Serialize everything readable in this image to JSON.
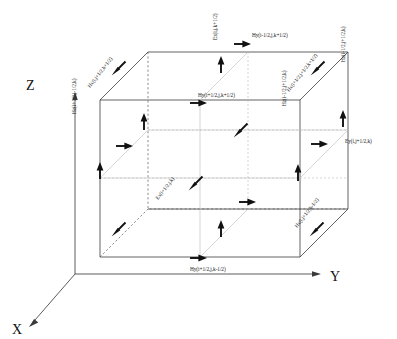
{
  "figure": {
    "type": "yee-cell-diagram",
    "axes": [
      {
        "name": "z-axis",
        "label": "Z",
        "direction": "up",
        "label_x": 26,
        "label_y": 90
      },
      {
        "name": "y-axis",
        "label": "Y",
        "direction": "right",
        "label_x": 330,
        "label_y": 281
      },
      {
        "name": "x-axis",
        "label": "X",
        "direction": "down-left",
        "label_x": 12,
        "label_y": 334
      }
    ],
    "field_labels": [
      {
        "name": "ez-top",
        "text": "Ez(i,j,k+1/2)",
        "x": 217,
        "y": 40,
        "rotate": -90
      },
      {
        "name": "hy-top-back",
        "text": "Hy(i-1/2,j,k+1/2)",
        "x": 252,
        "y": 37,
        "rotate": 0
      },
      {
        "name": "hx-top-left",
        "text": "Hx(i,j+1/2,k+1/2)",
        "x": 90,
        "y": 88,
        "rotate": -52
      },
      {
        "name": "hx-top-right",
        "text": "Hx(i+1/2,j+1/2,k+1/2)",
        "x": 289,
        "y": 92,
        "rotate": -52
      },
      {
        "name": "hz-right-back",
        "text": "Hz(i-1/2,j+1/2,k)",
        "x": 345,
        "y": 62,
        "rotate": -90
      },
      {
        "name": "hy-mid-front",
        "text": "Hy(i+1/2,j,k+1/2)",
        "x": 198,
        "y": 97,
        "rotate": 0
      },
      {
        "name": "hz-left-front",
        "text": "Hz(i+1/2,j-1/2,k)",
        "x": 76,
        "y": 114,
        "rotate": -90
      },
      {
        "name": "hz-mid-right",
        "text": "Hz(i-1/2,j+1/2,k)",
        "x": 286,
        "y": 106,
        "rotate": -90
      },
      {
        "name": "ey-right",
        "text": "Ey(i,j+1/2,k)",
        "x": 345,
        "y": 143,
        "rotate": 0
      },
      {
        "name": "ex-interior",
        "text": "Ex(i+1/2,j,k)",
        "x": 158,
        "y": 200,
        "rotate": -52
      },
      {
        "name": "hx-bottom-right",
        "text": "Hx(i,j+1/2,k-1/2)",
        "x": 297,
        "y": 228,
        "rotate": -52
      },
      {
        "name": "hy-bottom-front",
        "text": "Hy(i+1/2,j,k-1/2)",
        "x": 190,
        "y": 271,
        "rotate": 0
      }
    ],
    "vectors": [
      {
        "name": "vector-ez-top",
        "kind": "up",
        "x": 221,
        "y": 64
      },
      {
        "name": "vector-hy-top-back",
        "kind": "right",
        "x": 243,
        "y": 44
      },
      {
        "name": "vector-hx-top-left",
        "kind": "diag",
        "x": 118,
        "y": 69
      },
      {
        "name": "vector-hx-top-right",
        "kind": "diag",
        "x": 317,
        "y": 69
      },
      {
        "name": "vector-hz-right-back",
        "kind": "up",
        "x": 343,
        "y": 118
      },
      {
        "name": "vector-hy-mid-front",
        "kind": "right",
        "x": 199,
        "y": 103
      },
      {
        "name": "vector-ez-left-upper",
        "kind": "up",
        "x": 144,
        "y": 121
      },
      {
        "name": "vector-hz-left-mid",
        "kind": "right",
        "x": 125,
        "y": 146
      },
      {
        "name": "vector-hz-left-lower",
        "kind": "up",
        "x": 100,
        "y": 170
      },
      {
        "name": "vector-hz-mid-right",
        "kind": "diag",
        "x": 240,
        "y": 131
      },
      {
        "name": "vector-ey-right",
        "kind": "right",
        "x": 320,
        "y": 144
      },
      {
        "name": "vector-hz-right-lower",
        "kind": "up",
        "x": 298,
        "y": 172
      },
      {
        "name": "vector-ex-interior-diag",
        "kind": "diag",
        "x": 195,
        "y": 184
      },
      {
        "name": "vector-ex-interior-right",
        "kind": "right",
        "x": 248,
        "y": 202
      },
      {
        "name": "vector-hx-bottom-left",
        "kind": "diag",
        "x": 118,
        "y": 230
      },
      {
        "name": "vector-hx-bottom-right",
        "kind": "diag",
        "x": 316,
        "y": 230
      },
      {
        "name": "vector-ez-bottom",
        "kind": "up",
        "x": 221,
        "y": 228
      },
      {
        "name": "vector-hy-bottom-front",
        "kind": "right",
        "x": 199,
        "y": 258
      }
    ]
  }
}
